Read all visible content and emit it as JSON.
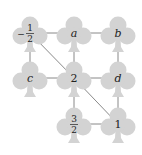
{
  "diagram": {
    "type": "graph",
    "node_shape": "club",
    "colors": {
      "node_fill": "#d3d3d3",
      "edge": "#6b6b6b",
      "label": "#222222",
      "background": "#ffffff"
    },
    "nodes": [
      {
        "id": "n_neg_half",
        "label": "-1/2",
        "num": "1",
        "den": "2",
        "sign": "−",
        "kind": "fraction",
        "x": 30,
        "y": 33
      },
      {
        "id": "n_a",
        "label": "a",
        "kind": "var",
        "x": 74,
        "y": 33
      },
      {
        "id": "n_b",
        "label": "b",
        "kind": "var",
        "x": 118,
        "y": 33
      },
      {
        "id": "n_c",
        "label": "c",
        "kind": "var",
        "x": 30,
        "y": 78
      },
      {
        "id": "n_2",
        "label": "2",
        "kind": "num",
        "x": 74,
        "y": 78
      },
      {
        "id": "n_d",
        "label": "d",
        "kind": "var",
        "x": 118,
        "y": 78
      },
      {
        "id": "n_3_2",
        "label": "3/2",
        "num": "3",
        "den": "2",
        "sign": "",
        "kind": "fraction",
        "x": 74,
        "y": 124
      },
      {
        "id": "n_1",
        "label": "1",
        "kind": "num",
        "x": 118,
        "y": 124
      }
    ],
    "edges": [
      [
        "n_neg_half",
        "n_a"
      ],
      [
        "n_a",
        "n_b"
      ],
      [
        "n_neg_half",
        "n_c"
      ],
      [
        "n_a",
        "n_2"
      ],
      [
        "n_b",
        "n_d"
      ],
      [
        "n_c",
        "n_2"
      ],
      [
        "n_2",
        "n_d"
      ],
      [
        "n_2",
        "n_3_2"
      ],
      [
        "n_d",
        "n_1"
      ],
      [
        "n_3_2",
        "n_1"
      ],
      [
        "n_neg_half",
        "n_2"
      ],
      [
        "n_2",
        "n_1"
      ]
    ]
  }
}
